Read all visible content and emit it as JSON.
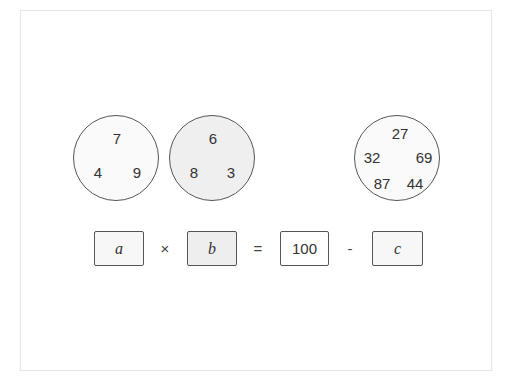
{
  "circles": [
    {
      "id": "circle-1",
      "numbers": [
        "7",
        "4",
        "9"
      ],
      "fill": "#fafafa"
    },
    {
      "id": "circle-2",
      "numbers": [
        "6",
        "8",
        "3"
      ],
      "fill": "#efefef"
    },
    {
      "id": "circle-3",
      "numbers": [
        "27",
        "32",
        "69",
        "87",
        "44"
      ],
      "fill": "#fafafa"
    }
  ],
  "equation": {
    "box_a": "a",
    "op_times": "×",
    "box_b": "b",
    "op_equals": "=",
    "constant": "100",
    "op_minus": "-",
    "box_c": "c"
  },
  "colors": {
    "stroke": "#555555",
    "text": "#333333",
    "shaded_fill": "#eeeeee"
  }
}
